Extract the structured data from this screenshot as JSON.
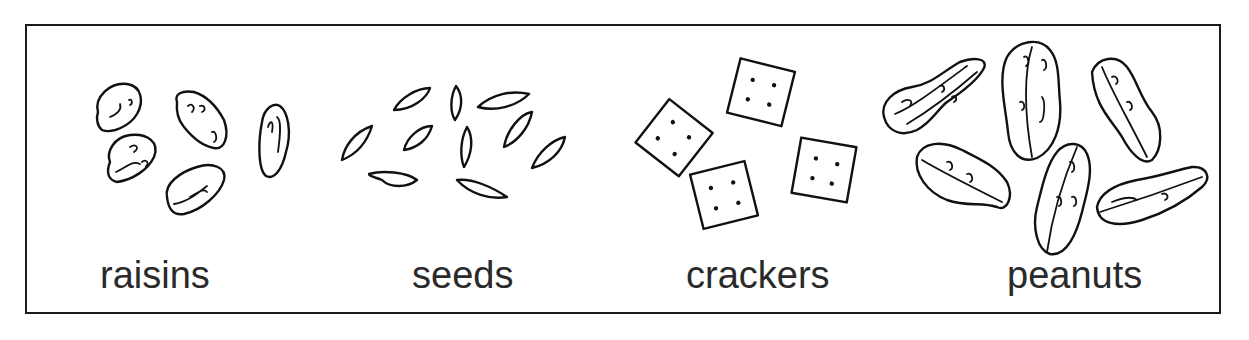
{
  "figure": {
    "type": "snack-mix ingredients illustration",
    "items": [
      {
        "id": "raisins",
        "label": "raisins",
        "count_drawn": 5
      },
      {
        "id": "seeds",
        "label": "seeds",
        "count_drawn": 10
      },
      {
        "id": "crackers",
        "label": "crackers",
        "count_drawn": 4
      },
      {
        "id": "peanuts",
        "label": "peanuts",
        "count_drawn": 6
      }
    ]
  },
  "colors": {
    "line": "#111111",
    "text": "#2a2a2a",
    "background": "#ffffff"
  }
}
